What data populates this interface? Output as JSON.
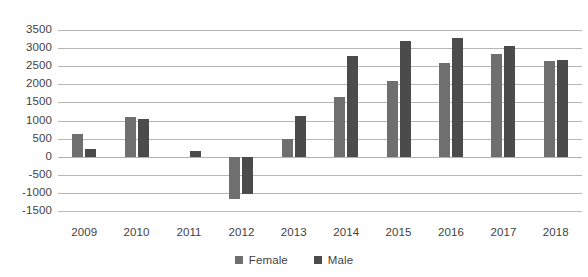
{
  "chart_data": {
    "type": "bar",
    "title": "",
    "subtitle": "",
    "xlabel": "",
    "ylabel": "",
    "categories": [
      "2009",
      "2010",
      "2011",
      "2012",
      "2013",
      "2014",
      "2015",
      "2016",
      "2017",
      "2018"
    ],
    "series": [
      {
        "name": "Female",
        "color": "#6f6f6f",
        "values": [
          620,
          1100,
          0,
          -1160,
          480,
          1640,
          2080,
          2580,
          2850,
          2640
        ]
      },
      {
        "name": "Male",
        "color": "#4b4b4b",
        "values": [
          200,
          1050,
          170,
          -1040,
          1130,
          2780,
          3200,
          3280,
          3050,
          2670
        ]
      }
    ],
    "ylim": [
      -1500,
      3500
    ],
    "ytick_step": 500,
    "yticks": [
      "3500",
      "3000",
      "2500",
      "2000",
      "1500",
      "1000",
      "500",
      "0",
      "-500",
      "-1000",
      "-1500"
    ],
    "grid": "horizontal",
    "legend_position": "bottom",
    "legend": [
      "Female",
      "Male"
    ],
    "background_color": "#ffffff",
    "gridline_color": "#b6b6b6",
    "text_color": "#3f3f3f"
  }
}
